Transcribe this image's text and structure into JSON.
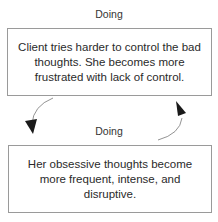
{
  "diagram": {
    "top_label": "Doing",
    "middle_label": "Doing",
    "top_box": {
      "text": "Client tries harder to control the bad thoughts. She becomes more frustrated with lack of control."
    },
    "bottom_box": {
      "text": "Her obsessive thoughts become more frequent, intense, and disruptive."
    },
    "arrows": [
      {
        "name": "arrow-top-to-bottom",
        "direction": "down",
        "side": "left"
      },
      {
        "name": "arrow-bottom-to-top",
        "direction": "up",
        "side": "right"
      }
    ],
    "colors": {
      "border": "#9a9a9a",
      "arrow": "#1a1a1a",
      "text": "#2a2a2a"
    }
  }
}
